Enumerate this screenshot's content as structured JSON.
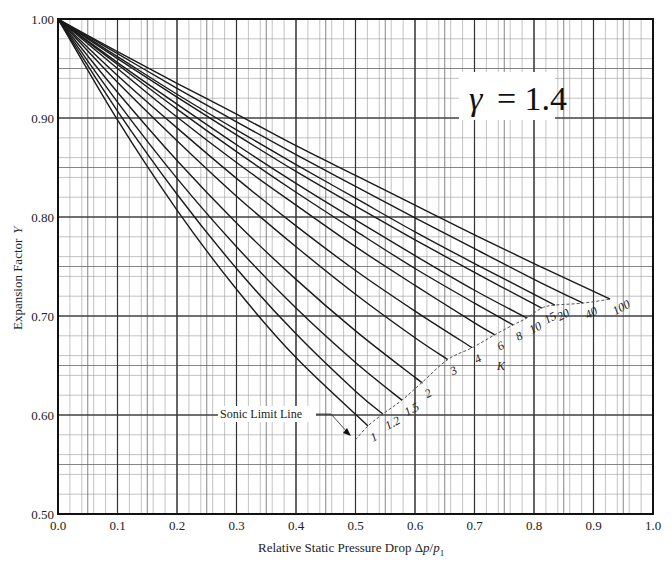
{
  "chart_data": {
    "type": "line",
    "title": "",
    "annotation_gamma": "γ = 1.4",
    "gamma_symbol": "γ",
    "gamma_value": "= 1.4",
    "xlabel": "Relative Static Pressure Drop Δp/p",
    "xlabel_main": "Relative Static Pressure Drop Δ",
    "xlabel_p": "p",
    "xlabel_sub": "1",
    "ylabel": "Expansion Factor Y",
    "ylabel_main": "Expansion Factor",
    "ylabel_var": "Y",
    "xlim": [
      0.0,
      1.0
    ],
    "ylim": [
      0.5,
      1.0
    ],
    "x_ticks": [
      "0.0",
      "0.1",
      "0.2",
      "0.3",
      "0.4",
      "0.5",
      "0.6",
      "0.7",
      "0.8",
      "0.9",
      "1.0"
    ],
    "y_ticks": [
      "0.50",
      "0.60",
      "0.70",
      "0.80",
      "0.90",
      "1.00"
    ],
    "grid": {
      "major_x": 0.1,
      "minor_x": 0.02,
      "major_y": 0.1,
      "minor_y": 0.02,
      "on": true
    },
    "legend": "none (curves labeled inline by K)",
    "k_axis_label": "K",
    "sonic_limit_label": "Sonic Limit Line",
    "series": [
      {
        "name": "1",
        "label": "1",
        "x": [
          0,
          0.1,
          0.2,
          0.3,
          0.4,
          0.521
        ],
        "y": [
          1.0,
          0.898,
          0.807,
          0.727,
          0.658,
          0.589
        ]
      },
      {
        "name": "1.2",
        "label": "1.2",
        "x": [
          0,
          0.1,
          0.2,
          0.3,
          0.4,
          0.5,
          0.546
        ],
        "y": [
          1.0,
          0.907,
          0.823,
          0.748,
          0.682,
          0.624,
          0.601
        ]
      },
      {
        "name": "1.5",
        "label": "1.5",
        "x": [
          0,
          0.1,
          0.2,
          0.3,
          0.4,
          0.5,
          0.578
        ],
        "y": [
          1.0,
          0.916,
          0.839,
          0.77,
          0.708,
          0.653,
          0.615
        ]
      },
      {
        "name": "2",
        "label": "2",
        "x": [
          0,
          0.1,
          0.2,
          0.3,
          0.4,
          0.5,
          0.6,
          0.612
        ],
        "y": [
          1.0,
          0.926,
          0.857,
          0.794,
          0.737,
          0.685,
          0.638,
          0.633
        ]
      },
      {
        "name": "3",
        "label": "3",
        "x": [
          0,
          0.1,
          0.2,
          0.3,
          0.4,
          0.5,
          0.6,
          0.655
        ],
        "y": [
          1.0,
          0.936,
          0.877,
          0.821,
          0.77,
          0.722,
          0.678,
          0.656
        ]
      },
      {
        "name": "4",
        "label": "4",
        "x": [
          0,
          0.1,
          0.2,
          0.3,
          0.4,
          0.5,
          0.6,
          0.696
        ],
        "y": [
          1.0,
          0.943,
          0.89,
          0.839,
          0.791,
          0.746,
          0.705,
          0.668
        ]
      },
      {
        "name": "6",
        "label": "6",
        "x": [
          0,
          0.1,
          0.2,
          0.3,
          0.4,
          0.5,
          0.6,
          0.7,
          0.734
        ],
        "y": [
          1.0,
          0.95,
          0.901,
          0.855,
          0.812,
          0.77,
          0.731,
          0.693,
          0.681
        ]
      },
      {
        "name": "8",
        "label": "8",
        "x": [
          0,
          0.1,
          0.2,
          0.3,
          0.4,
          0.5,
          0.6,
          0.7,
          0.765
        ],
        "y": [
          1.0,
          0.954,
          0.909,
          0.866,
          0.825,
          0.786,
          0.748,
          0.713,
          0.691
        ]
      },
      {
        "name": "10",
        "label": "10",
        "x": [
          0,
          0.1,
          0.2,
          0.3,
          0.4,
          0.5,
          0.6,
          0.7,
          0.788
        ],
        "y": [
          1.0,
          0.956,
          0.914,
          0.873,
          0.834,
          0.797,
          0.761,
          0.726,
          0.698
        ]
      },
      {
        "name": "15",
        "label": "15",
        "x": [
          0,
          0.1,
          0.2,
          0.3,
          0.4,
          0.5,
          0.6,
          0.7,
          0.813
        ],
        "y": [
          1.0,
          0.96,
          0.921,
          0.883,
          0.846,
          0.811,
          0.777,
          0.744,
          0.708
        ]
      },
      {
        "name": "20",
        "label": "20",
        "x": [
          0,
          0.1,
          0.2,
          0.3,
          0.4,
          0.5,
          0.6,
          0.7,
          0.835
        ],
        "y": [
          1.0,
          0.962,
          0.924,
          0.888,
          0.853,
          0.819,
          0.785,
          0.753,
          0.711
        ]
      },
      {
        "name": "40",
        "label": "40",
        "x": [
          0,
          0.1,
          0.2,
          0.3,
          0.4,
          0.5,
          0.6,
          0.7,
          0.8,
          0.882
        ],
        "y": [
          1.0,
          0.965,
          0.93,
          0.896,
          0.863,
          0.831,
          0.799,
          0.768,
          0.737,
          0.713
        ]
      },
      {
        "name": "100",
        "label": "100",
        "x": [
          0,
          0.1,
          0.2,
          0.3,
          0.4,
          0.5,
          0.6,
          0.7,
          0.8,
          0.928
        ],
        "y": [
          1.0,
          0.967,
          0.935,
          0.904,
          0.872,
          0.842,
          0.812,
          0.782,
          0.753,
          0.717
        ]
      }
    ],
    "sonic_limit_line": {
      "style": "dashed",
      "x": [
        0.5,
        0.521,
        0.546,
        0.578,
        0.612,
        0.655,
        0.696,
        0.734,
        0.765,
        0.788,
        0.813,
        0.835,
        0.882,
        0.928
      ],
      "y": [
        0.575,
        0.589,
        0.601,
        0.615,
        0.633,
        0.656,
        0.668,
        0.681,
        0.691,
        0.698,
        0.708,
        0.711,
        0.713,
        0.717
      ]
    },
    "colors": {
      "curve": "#1a1a1a",
      "grid_major": "#333333",
      "grid_minor": "#9a9a9a",
      "background": "#ffffff"
    }
  }
}
